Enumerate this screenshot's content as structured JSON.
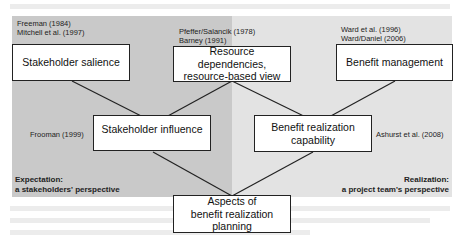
{
  "diagram": {
    "panels": {
      "left": {
        "title_line1": "Expectation:",
        "title_line2": "a stakeholders' perspective",
        "color": "#c9c9c9"
      },
      "right": {
        "title_line1": "Realization:",
        "title_line2": "a project team's perspective",
        "color": "#e3e3e3"
      }
    },
    "boxes": {
      "stakeholder_salience": "Stakeholder salience",
      "resource": {
        "line1": "Resource",
        "line2": "dependencies,",
        "line3": "resource-based view"
      },
      "benefit_management": "Benefit management",
      "stakeholder_influence": "Stakeholder influence",
      "benefit_realization": {
        "line1": "Benefit realization",
        "line2": "capability"
      },
      "aspects": {
        "line1": "Aspects of",
        "line2": "benefit realization",
        "line3": "planning"
      }
    },
    "references": {
      "salience_1": "Freeman (1984)",
      "salience_2": "Mitchell et al. (1997)",
      "resource_1": "Pfeffer/Salancik (1978)",
      "resource_2": "Barney (1991)",
      "management_1": "Ward et al. (1996)",
      "management_2": "Ward/Daniel (2006)",
      "influence_1": "Frooman (1999)",
      "capability_1": "Ashurst et al. (2008)"
    }
  }
}
